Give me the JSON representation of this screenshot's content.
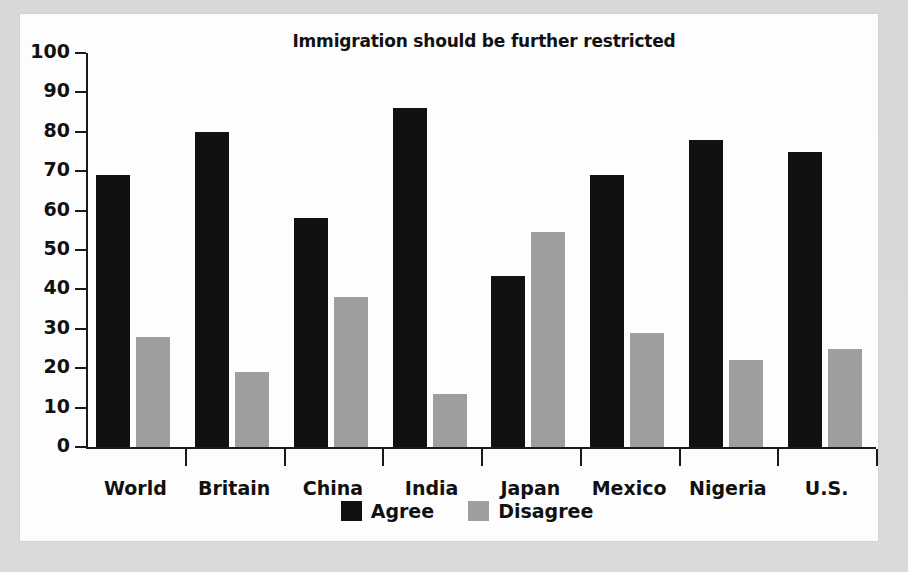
{
  "panel": {
    "background_color": "#fdfdfd",
    "outer_background_color": "#dcdcdc"
  },
  "legend": {
    "position": "bottom-center",
    "items": [
      {
        "label": "Agree",
        "color": "#111111",
        "swatch_name": "legend-swatch-agree"
      },
      {
        "label": "Disagree",
        "color": "#9e9e9e",
        "swatch_name": "legend-swatch-disagree"
      }
    ]
  },
  "chart_data": {
    "type": "bar",
    "title": "Immigration should be further restricted",
    "xlabel": "",
    "ylabel": "",
    "ylim": [
      0,
      100
    ],
    "yticks": [
      0,
      10,
      20,
      30,
      40,
      50,
      60,
      70,
      80,
      90,
      100
    ],
    "ytick_labels": [
      "0",
      "10",
      "20",
      "30",
      "40",
      "50",
      "60",
      "70",
      "80",
      "90",
      "100"
    ],
    "grid": false,
    "legend_position": "bottom-center",
    "categories": [
      "World",
      "Britain",
      "China",
      "India",
      "Japan",
      "Mexico",
      "Nigeria",
      "U.S."
    ],
    "series": [
      {
        "name": "Agree",
        "color": "#111111",
        "values": [
          69,
          80,
          58,
          86,
          43.5,
          69,
          78,
          75
        ]
      },
      {
        "name": "Disagree",
        "color": "#9e9e9e",
        "values": [
          28,
          19,
          38,
          13.5,
          54.5,
          29,
          22,
          25
        ]
      }
    ]
  }
}
